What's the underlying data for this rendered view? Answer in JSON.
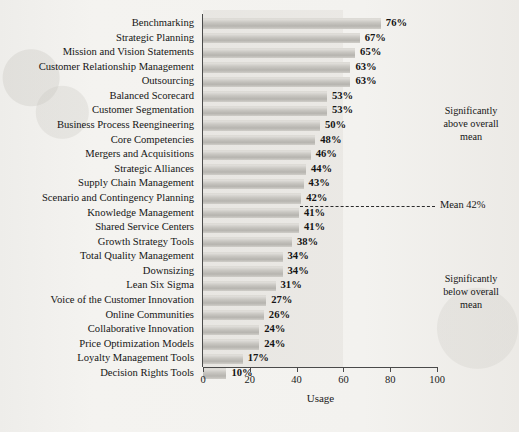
{
  "chart_data": {
    "type": "bar",
    "orientation": "horizontal",
    "title": "",
    "xlabel": "Usage",
    "ylabel": "",
    "xlim": [
      0,
      100
    ],
    "xticks": [
      0,
      20,
      40,
      60,
      80,
      100
    ],
    "grid": false,
    "legend": "none",
    "value_suffix": "%",
    "categories": [
      "Benchmarking",
      "Strategic Planning",
      "Mission and Vision Statements",
      "Customer Relationship Management",
      "Outsourcing",
      "Balanced Scorecard",
      "Customer Segmentation",
      "Business Process Reengineering",
      "Core Competencies",
      "Mergers and Acquisitions",
      "Strategic Alliances",
      "Supply Chain Management",
      "Scenario and Contingency Planning",
      "Knowledge Management",
      "Shared Service Centers",
      "Growth Strategy Tools",
      "Total Quality Management",
      "Downsizing",
      "Lean Six Sigma",
      "Voice of the Customer Innovation",
      "Online Communities",
      "Collaborative Innovation",
      "Price Optimization Models",
      "Loyalty Management Tools",
      "Decision Rights Tools"
    ],
    "values": [
      76,
      67,
      65,
      63,
      63,
      53,
      53,
      50,
      48,
      46,
      44,
      43,
      42,
      41,
      41,
      38,
      34,
      34,
      31,
      27,
      26,
      24,
      24,
      17,
      10
    ],
    "value_labels": [
      "76%",
      "67%",
      "65%",
      "63%",
      "63%",
      "53%",
      "53%",
      "50%",
      "48%",
      "46%",
      "44%",
      "43%",
      "42%",
      "41%",
      "41%",
      "38%",
      "34%",
      "34%",
      "31%",
      "27%",
      "26%",
      "24%",
      "24%",
      "17%",
      "10%"
    ],
    "reference_line": {
      "label": "Mean 42%",
      "value": 42,
      "style": "dashed"
    },
    "annotations": [
      {
        "id": "above",
        "text": "Significantly above overall mean"
      },
      {
        "id": "below",
        "text": "Significantly below overall mean"
      }
    ],
    "annotation_lines": {
      "above": [
        "Significantly",
        "above overall",
        "mean"
      ],
      "below": [
        "Significantly",
        "below overall",
        "mean"
      ]
    },
    "colors": {
      "bar": "#c3c1bc",
      "page_background": "#f2f1ee",
      "panel_shade": "#e7e5e1",
      "axis": "#4a4a4a",
      "text": "#151515"
    }
  }
}
